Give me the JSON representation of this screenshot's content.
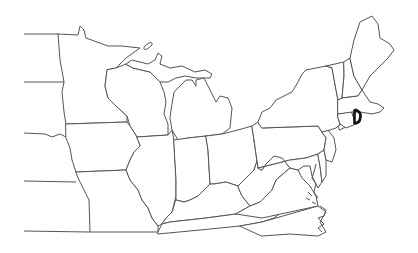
{
  "map": {
    "type": "outline-map",
    "region": "Eastern United States",
    "background": "#ffffff",
    "border_color": "#555555",
    "highlight_color": "#111111",
    "highlighted_state": "Rhode Island",
    "states": [
      "Minnesota",
      "Wisconsin",
      "Michigan",
      "Iowa",
      "Illinois",
      "Indiana",
      "Ohio",
      "Missouri",
      "Kentucky",
      "Tennessee",
      "West Virginia",
      "Virginia",
      "North Carolina",
      "Pennsylvania",
      "New York",
      "New Jersey",
      "Delaware",
      "Maryland",
      "Vermont",
      "New Hampshire",
      "Maine",
      "Massachusetts",
      "Connecticut",
      "Rhode Island",
      "North Dakota",
      "South Dakota",
      "Nebraska",
      "Kansas"
    ],
    "labels": []
  }
}
